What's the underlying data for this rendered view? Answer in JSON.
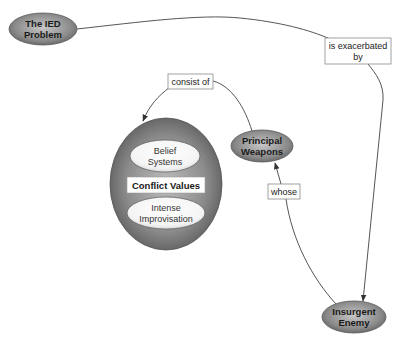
{
  "nodes": {
    "ied_problem": {
      "lines": [
        "The IED",
        "Problem"
      ]
    },
    "principal_weapons": {
      "lines": [
        "Principal",
        "Weapons"
      ]
    },
    "insurgent_enemy": {
      "lines": [
        "Insurgent",
        "Enemy"
      ]
    },
    "conflict_values": {
      "label": "Conflict Values",
      "belief_systems": {
        "lines": [
          "Belief",
          "Systems"
        ]
      },
      "intense_improvisation": {
        "lines": [
          "Intense",
          "Improvisation"
        ]
      }
    }
  },
  "links": {
    "is_exacerbated_by": {
      "lines": [
        "is exacerbated",
        "by"
      ]
    },
    "consist_of": {
      "label": "consist of"
    },
    "whose": {
      "label": "whose"
    }
  },
  "colors": {
    "node_fill_dark": "#6e6e6e",
    "node_fill_light": "#bdbdbd",
    "line": "#555555",
    "label_border": "#888888"
  }
}
